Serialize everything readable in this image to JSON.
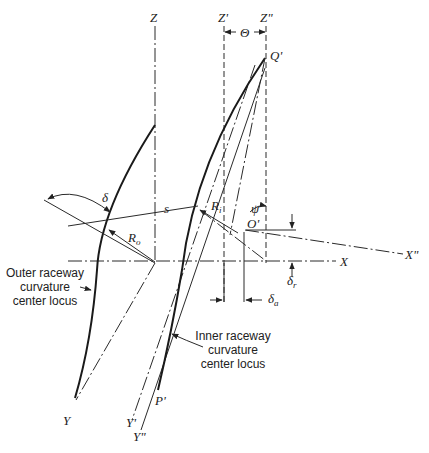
{
  "diagram": {
    "type": "bearing-geometry",
    "axes": {
      "z": "Z",
      "z_prime": "Z'",
      "z_double_prime": "Z\"",
      "x": "X",
      "x_double_prime": "X\"",
      "y": "Y",
      "y_prime": "Y'",
      "y_double_prime": "Y\""
    },
    "points": {
      "q_prime": "Q'",
      "o_prime": "O'",
      "p_prime": "P'"
    },
    "symbols": {
      "theta": "Θ",
      "delta": "δ",
      "s": "s",
      "r_o": "R",
      "r_o_sub": "o",
      "r_i": "R",
      "r_i_sub": "i",
      "psi": "ψ",
      "delta_a": "δ",
      "delta_a_sub": "a",
      "delta_r": "δ",
      "delta_r_sub": "r"
    },
    "captions": {
      "outer": [
        "Outer raceway",
        "curvature",
        "center locus"
      ],
      "inner": [
        "Inner raceway",
        "curvature",
        "center locus"
      ]
    }
  }
}
